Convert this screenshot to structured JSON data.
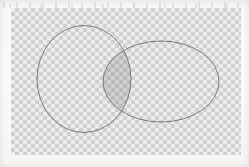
{
  "canvas": {
    "width": 249,
    "height": 167,
    "background_color": "#f8f7f5",
    "label": "transparent canvas"
  },
  "checkerboard": {
    "label": "transparency checkerboard",
    "x": 11,
    "y": 8,
    "width": 230,
    "height": 147,
    "square_size_px": 4,
    "light_color": "#eaeaea",
    "dark_color": "#c6c6c6"
  },
  "shapes": {
    "outline_color": "#6f6f6f",
    "outline_width": 0.9,
    "fill_color": "none",
    "intersection_fill": "rgba(108,108,108,0.22)",
    "items": [
      {
        "name": "left-circle",
        "type": "circle",
        "cx": 84,
        "cy": 79,
        "rx": 47,
        "ry": 53.5,
        "fill": "none",
        "stroke": "#6f6f6f"
      },
      {
        "name": "right-ellipse",
        "type": "ellipse",
        "cx": 161,
        "cy": 81.5,
        "rx": 58,
        "ry": 40.5,
        "fill": "none",
        "stroke": "#6f6f6f"
      }
    ]
  },
  "intersection": {
    "name": "overlap-lens",
    "label": "shaded overlap region",
    "top_point": {
      "x": 113,
      "y": 45
    },
    "bottom_point": {
      "x": 113,
      "y": 120
    },
    "fill": "rgba(108,108,108,0.22)"
  }
}
